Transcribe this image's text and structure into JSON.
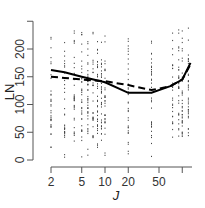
{
  "chart_data": {
    "type": "scatter",
    "title": "",
    "xlabel": "J",
    "ylabel": "LN",
    "x_scale": "log",
    "xlim": [
      2,
      130
    ],
    "ylim": [
      0,
      250
    ],
    "x_ticks": [
      2,
      5,
      10,
      20,
      50,
      100
    ],
    "x_tick_labels": [
      "2",
      "5",
      "10",
      "20",
      "50",
      ""
    ],
    "y_ticks": [
      0,
      50,
      100,
      150,
      200,
      250
    ],
    "y_tick_labels": [
      "0",
      "50",
      "100",
      "150",
      "200",
      ""
    ],
    "grid": false,
    "legend": null,
    "scatter_columns_x": [
      2,
      3,
      4,
      5,
      6,
      7,
      8,
      9,
      10,
      20,
      40,
      75,
      90,
      100,
      120
    ],
    "series": [
      {
        "name": "solid-fit",
        "style": "solid",
        "x": [
          2,
          3,
          5,
          10,
          20,
          40,
          70,
          100,
          128
        ],
        "y": [
          162,
          158,
          150,
          140,
          121,
          121,
          133,
          145,
          175
        ]
      },
      {
        "name": "dashed-fit",
        "style": "dashed",
        "x": [
          2,
          3,
          5,
          10,
          20,
          40,
          70,
          100,
          128
        ],
        "y": [
          150,
          148,
          145,
          142,
          135,
          126,
          133,
          145,
          172
        ]
      }
    ]
  },
  "axes": {
    "x_title": "J",
    "y_title": "LN",
    "x_tick_labels": [
      "2",
      "5",
      "10",
      "20",
      "50"
    ],
    "y_tick_labels": [
      "0",
      "50",
      "100",
      "150",
      "200"
    ]
  }
}
